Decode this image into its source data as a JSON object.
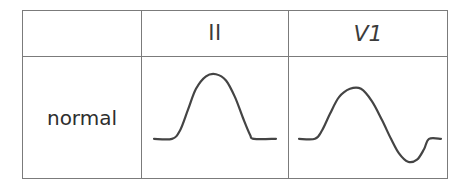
{
  "figure": {
    "kind": "ecg-p-wave-morphology-table",
    "background_color": "#ffffff",
    "border_color": "#7b7b7b",
    "trace_color": "#444444"
  },
  "table": {
    "columns": [
      {
        "id": "condition",
        "header": ""
      },
      {
        "id": "lead_ii",
        "header": "II"
      },
      {
        "id": "lead_v1",
        "header": "V1"
      }
    ],
    "rows": [
      {
        "label": "normal",
        "lead_ii": {
          "icon_name": "p-wave-upright-trace",
          "description": "upright rounded P wave on flat baseline"
        },
        "lead_v1": {
          "icon_name": "p-wave-biphasic-trace",
          "description": "biphasic P wave, positive then negative, on flat baseline"
        }
      }
    ]
  },
  "chart_data": {
    "type": "line",
    "title": "",
    "xlabel": "",
    "ylabel": "",
    "grid": false,
    "legend": "none",
    "panels": [
      {
        "name": "normal-lead-II",
        "row": "normal",
        "lead": "II",
        "morphology": "monophasic positive (upright) P wave",
        "xlim": [
          0,
          147
        ],
        "ylim": [
          -14,
          34
        ],
        "baseline_y": 0,
        "points": [
          [
            12,
            0
          ],
          [
            30,
            0
          ],
          [
            38,
            4
          ],
          [
            46,
            14
          ],
          [
            54,
            24
          ],
          [
            64,
            30
          ],
          [
            74,
            31
          ],
          [
            84,
            28
          ],
          [
            93,
            20
          ],
          [
            101,
            10
          ],
          [
            108,
            2
          ],
          [
            112,
            0
          ],
          [
            134,
            0
          ]
        ]
      },
      {
        "name": "normal-lead-V1",
        "row": "normal",
        "lead": "V1",
        "morphology": "biphasic P wave (positive deflection followed by negative deflection)",
        "xlim": [
          0,
          159
        ],
        "ylim": [
          -14,
          34
        ],
        "baseline_y": 0,
        "points": [
          [
            10,
            0
          ],
          [
            26,
            0
          ],
          [
            33,
            4
          ],
          [
            41,
            12
          ],
          [
            50,
            20
          ],
          [
            61,
            24
          ],
          [
            72,
            24
          ],
          [
            83,
            18
          ],
          [
            93,
            9
          ],
          [
            102,
            0
          ],
          [
            110,
            -7
          ],
          [
            119,
            -11
          ],
          [
            128,
            -10
          ],
          [
            135,
            -5
          ],
          [
            140,
            0
          ],
          [
            152,
            0
          ]
        ]
      }
    ]
  }
}
